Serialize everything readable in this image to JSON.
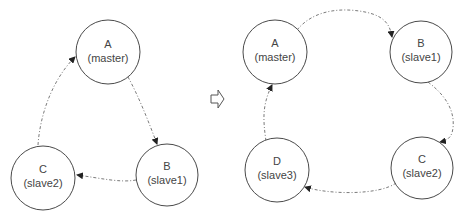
{
  "diagrams": [
    {
      "name": "before",
      "nodes": [
        {
          "id": "A",
          "letter": "A",
          "role": "(master)"
        },
        {
          "id": "B",
          "letter": "B",
          "role": "(slave1)"
        },
        {
          "id": "C",
          "letter": "C",
          "role": "(slave2)"
        }
      ],
      "edges": [
        {
          "from": "A",
          "to": "B"
        },
        {
          "from": "B",
          "to": "C"
        },
        {
          "from": "C",
          "to": "A"
        }
      ]
    },
    {
      "name": "after",
      "nodes": [
        {
          "id": "A",
          "letter": "A",
          "role": "(master)"
        },
        {
          "id": "B",
          "letter": "B",
          "role": "(slave1)"
        },
        {
          "id": "C",
          "letter": "C",
          "role": "(slave2)"
        },
        {
          "id": "D",
          "letter": "D",
          "role": "(slave3)"
        }
      ],
      "edges": [
        {
          "from": "A",
          "to": "B"
        },
        {
          "from": "B",
          "to": "C"
        },
        {
          "from": "C",
          "to": "D"
        },
        {
          "from": "D",
          "to": "A"
        }
      ]
    }
  ],
  "transition_icon": "hollow-right-arrow-icon"
}
